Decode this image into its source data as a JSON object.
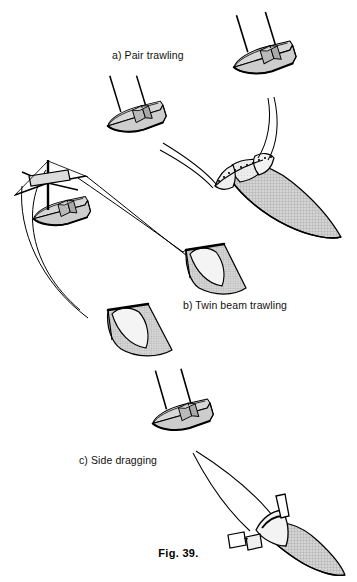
{
  "figure": {
    "caption": "Fig.  39.",
    "background_color": "#ffffff",
    "ink_color": "#000000",
    "deck_color": "#c9c9c9",
    "cabin_color": "#bdbdbd",
    "net_mesh_color": "#b5b5b5",
    "net_fill_color": "#d0d0d0",
    "codend_color": "#e8e8e8"
  },
  "panels": [
    {
      "id": "a",
      "label": "a) Pair trawling",
      "description": "Two vessels towing a single large trawl net between them",
      "vessel_count": 2,
      "net_count": 1
    },
    {
      "id": "b",
      "label": "b) Twin beam trawling",
      "description": "One vessel with outrigger booms towing two beam trawls",
      "vessel_count": 1,
      "net_count": 2
    },
    {
      "id": "c",
      "label": "c) Side dragging",
      "description": "One vessel towing a single dredge net from the side",
      "vessel_count": 1,
      "net_count": 1
    }
  ],
  "icons": {
    "vessel": "fishing-vessel-icon",
    "net": "trawl-net-icon",
    "beam": "trawl-beam-icon",
    "warp": "tow-warp-line-icon"
  }
}
